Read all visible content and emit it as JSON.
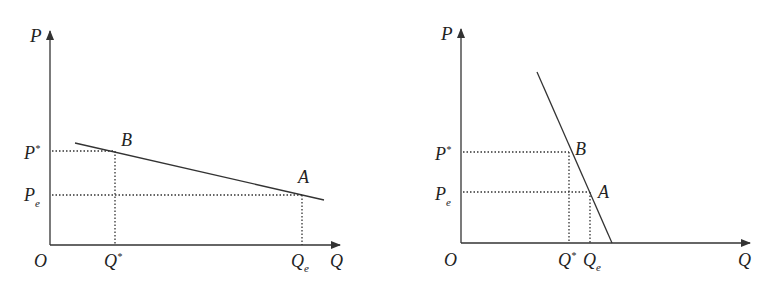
{
  "figures": [
    {
      "id": "left",
      "description": "Elastic (flat) demand curve",
      "axes": {
        "y_label": "P",
        "x_label": "Q",
        "origin_label": "O"
      },
      "points": {
        "B": {
          "label": "B",
          "price_label": "P",
          "price_sup": "*",
          "qty_label": "Q",
          "qty_sup": "*"
        },
        "A": {
          "label": "A",
          "price_label": "P",
          "price_sub": "e",
          "qty_label": "Q",
          "qty_sub": "e"
        }
      }
    },
    {
      "id": "right",
      "description": "Inelastic (steep) demand curve",
      "axes": {
        "y_label": "P",
        "x_label": "Q",
        "origin_label": "O"
      },
      "points": {
        "B": {
          "label": "B",
          "price_label": "P",
          "price_sup": "*",
          "qty_label": "Q",
          "qty_sup": "*"
        },
        "A": {
          "label": "A",
          "price_label": "P",
          "price_sub": "e",
          "qty_label": "Q",
          "qty_sub": "e"
        }
      }
    }
  ],
  "colors": {
    "line": "#333333",
    "text": "#222222"
  }
}
